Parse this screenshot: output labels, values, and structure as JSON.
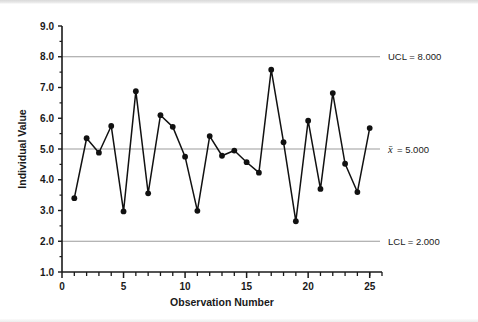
{
  "chart_data": {
    "type": "line",
    "title": "",
    "subtitle": "",
    "xlabel": "Observation Number",
    "ylabel": "Individual Value",
    "xlim": [
      0,
      26
    ],
    "ylim": [
      1.0,
      9.0
    ],
    "grid": "horizontal-control-limits-only",
    "legend": "none",
    "x": [
      1,
      2,
      3,
      4,
      5,
      6,
      7,
      8,
      9,
      10,
      11,
      12,
      13,
      14,
      15,
      16,
      17,
      18,
      19,
      20,
      21,
      22,
      23,
      24,
      25
    ],
    "values": [
      3.4,
      5.35,
      4.88,
      5.75,
      2.97,
      6.88,
      3.56,
      6.1,
      5.72,
      4.75,
      2.99,
      5.42,
      4.78,
      4.95,
      4.57,
      4.23,
      7.58,
      5.22,
      2.65,
      5.92,
      3.7,
      6.82,
      4.52,
      3.6,
      5.68
    ],
    "series": [
      {
        "name": "Individual Value",
        "values": [
          3.4,
          5.35,
          4.88,
          5.75,
          2.97,
          6.88,
          3.56,
          6.1,
          5.72,
          4.75,
          2.99,
          5.42,
          4.78,
          4.95,
          4.57,
          4.23,
          7.58,
          5.22,
          2.65,
          5.92,
          3.7,
          6.82,
          4.52,
          3.6,
          5.68
        ],
        "marker": "filled-circle",
        "color": "#111111"
      }
    ],
    "y_ticks": [
      "1.0",
      "2.0",
      "3.0",
      "4.0",
      "5.0",
      "6.0",
      "7.0",
      "8.0",
      "9.0"
    ],
    "y_tick_values": [
      1.0,
      2.0,
      3.0,
      4.0,
      5.0,
      6.0,
      7.0,
      8.0,
      9.0
    ],
    "x_ticks": [
      "0",
      "5",
      "10",
      "15",
      "20",
      "25"
    ],
    "x_tick_values": [
      0,
      5,
      10,
      15,
      20,
      25
    ],
    "x_minor_tick_values": [
      1,
      2,
      3,
      4,
      6,
      7,
      8,
      9,
      11,
      12,
      13,
      14,
      16,
      17,
      18,
      19,
      21,
      22,
      23,
      24,
      25,
      26
    ],
    "control_limits": [
      {
        "id": "ucl",
        "label": "UCL = 8.000",
        "value": 8.0,
        "color": "#9b9b9b"
      },
      {
        "id": "center",
        "label": "= 5.000",
        "symbol": "x̄",
        "value": 5.0,
        "color": "#9b9b9b"
      },
      {
        "id": "lcl",
        "label": "LCL = 2.000",
        "value": 2.0,
        "color": "#9b9b9b"
      }
    ],
    "colors": {
      "line": "#111111",
      "marker": "#111111",
      "limit_line": "#9b9b9b",
      "axis": "#1a1a1a",
      "background": "#ffffff",
      "plot_background": "#ffffff"
    }
  }
}
